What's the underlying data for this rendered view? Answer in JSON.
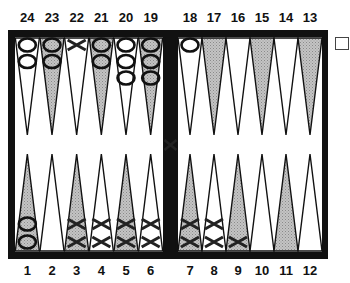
{
  "board": {
    "top_points": [
      "24",
      "23",
      "22",
      "21",
      "20",
      "19",
      "18",
      "17",
      "16",
      "15",
      "14",
      "13"
    ],
    "bottom_points": [
      "1",
      "2",
      "3",
      "4",
      "5",
      "6",
      "7",
      "8",
      "9",
      "10",
      "11",
      "12"
    ],
    "colors": {
      "frame": "#111111",
      "shaded_point": "#b8b8b8",
      "light_point": "#ffffff"
    },
    "checkers": {
      "24": {
        "player": "O",
        "count": 2
      },
      "23": {
        "player": "O",
        "count": 2
      },
      "22": {
        "player": "X",
        "count": 1
      },
      "21": {
        "player": "O",
        "count": 2
      },
      "20": {
        "player": "O",
        "count": 3
      },
      "19": {
        "player": "O",
        "count": 3
      },
      "18": {
        "player": "O",
        "count": 1
      },
      "1": {
        "player": "O",
        "count": 2
      },
      "3": {
        "player": "X",
        "count": 2
      },
      "4": {
        "player": "X",
        "count": 2
      },
      "5": {
        "player": "X",
        "count": 2
      },
      "6": {
        "player": "X",
        "count": 2
      },
      "7": {
        "player": "X",
        "count": 2
      },
      "8": {
        "player": "X",
        "count": 2
      },
      "9": {
        "player": "X",
        "count": 1
      }
    },
    "bar": {
      "player": "X",
      "count": 1
    },
    "doubling_cube": {
      "visible": true,
      "value": ""
    }
  }
}
